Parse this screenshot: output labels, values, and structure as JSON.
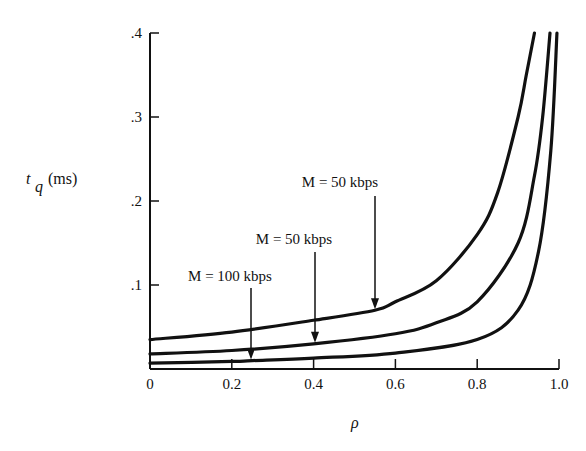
{
  "chart_data": {
    "type": "line",
    "title": "",
    "xlabel": "ρ",
    "ylabel": "t_q (ms)",
    "ylabel_main": "t",
    "ylabel_sub": "q",
    "ylabel_unit": "(ms)",
    "xlim": [
      0,
      1.0
    ],
    "ylim": [
      0,
      0.4
    ],
    "grid": false,
    "legend": "none (inline arrow annotations)",
    "x_ticks": [
      "0",
      "0.2",
      "0.4",
      "0.6",
      "0.8",
      "1.0"
    ],
    "y_ticks": [
      ".1",
      ".2",
      ".3",
      ".4"
    ],
    "series": [
      {
        "name": "upper curve",
        "x": [
          0,
          0.2,
          0.4,
          0.55,
          0.6,
          0.7,
          0.8,
          0.85,
          0.9,
          0.92,
          0.94
        ],
        "values": [
          0.035,
          0.044,
          0.058,
          0.07,
          0.08,
          0.105,
          0.16,
          0.21,
          0.3,
          0.35,
          0.4
        ]
      },
      {
        "name": "middle curve",
        "x": [
          0,
          0.2,
          0.4,
          0.6,
          0.7,
          0.8,
          0.9,
          0.94,
          0.96,
          0.978
        ],
        "values": [
          0.018,
          0.022,
          0.03,
          0.042,
          0.055,
          0.08,
          0.15,
          0.23,
          0.3,
          0.4
        ]
      },
      {
        "name": "lower curve",
        "x": [
          0,
          0.2,
          0.25,
          0.4,
          0.6,
          0.8,
          0.9,
          0.95,
          0.98,
          0.995
        ],
        "values": [
          0.007,
          0.009,
          0.01,
          0.013,
          0.019,
          0.035,
          0.07,
          0.14,
          0.26,
          0.4
        ]
      }
    ],
    "annotations": [
      {
        "text": "M = 100 kbps",
        "arrow_to": {
          "x": 0.25,
          "y": 0.01
        },
        "series": "lower curve"
      },
      {
        "text": "M = 50 kbps",
        "arrow_to": {
          "x": 0.4,
          "y": 0.03
        },
        "series": "middle curve"
      },
      {
        "text": "M = 50 kbps",
        "arrow_to": {
          "x": 0.55,
          "y": 0.07
        },
        "series": "upper curve"
      }
    ]
  }
}
